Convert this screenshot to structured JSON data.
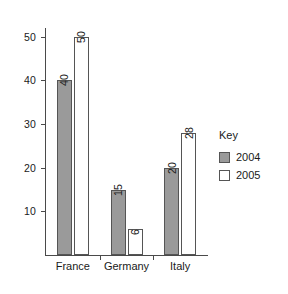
{
  "chart_data": {
    "type": "bar",
    "title": "",
    "xlabel": "",
    "ylabel": "",
    "categories": [
      "France",
      "Germany",
      "Italy"
    ],
    "series": [
      {
        "name": "2004",
        "values": [
          40,
          15,
          20
        ],
        "color": "#9a9a9a"
      },
      {
        "name": "2005",
        "values": [
          50,
          6,
          28
        ],
        "color": "#ffffff"
      }
    ],
    "ylim": [
      0,
      52
    ],
    "yticks": [
      10,
      20,
      30,
      40,
      50
    ],
    "ytick_labels": [
      "10",
      "20",
      "30",
      "40",
      "50"
    ],
    "grid": false,
    "value_labels_rotated": true,
    "legend": {
      "title": "Key",
      "position": "right",
      "entries": [
        {
          "label": "2004",
          "color": "#9a9a9a"
        },
        {
          "label": "2005",
          "color": "#ffffff"
        }
      ]
    }
  },
  "colors": {
    "series_2004": "#9a9a9a",
    "series_2005": "#ffffff",
    "outline": "#555555",
    "axis": "#4a4a4a",
    "text": "#1a1a1a",
    "background": "#ffffff"
  }
}
